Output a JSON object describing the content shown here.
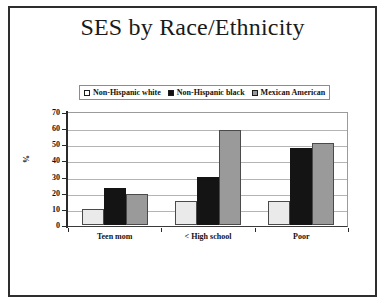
{
  "slide": {
    "title": "SES by Race/Ethnicity"
  },
  "chart_data": {
    "type": "bar",
    "title": "SES by Race/Ethnicity",
    "xlabel": "",
    "ylabel": "%",
    "ylim": [
      0,
      70
    ],
    "yticks": [
      0,
      10,
      20,
      30,
      40,
      50,
      60,
      70
    ],
    "grid": true,
    "legend_position": "top",
    "categories": [
      "Teen mom",
      "< High school",
      "Poor"
    ],
    "series": [
      {
        "name": "Non-Hispanic white",
        "color": "#eaeaea",
        "swatch": "white",
        "values": [
          10,
          15,
          15
        ]
      },
      {
        "name": "Non-Hispanic black",
        "color": "#141414",
        "swatch": "black",
        "values": [
          23,
          30,
          48
        ]
      },
      {
        "name": "Mexican American",
        "color": "#9a9a9a",
        "swatch": "gray",
        "values": [
          19,
          59,
          51
        ]
      }
    ]
  }
}
